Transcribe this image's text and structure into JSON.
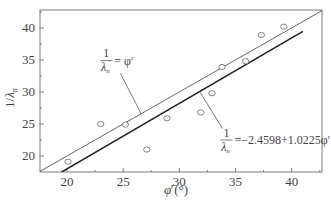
{
  "chart_data": {
    "type": "scatter",
    "title": "",
    "xlabel": "φ' (°)",
    "xlabel_var": "φ",
    "xlabel_sup": "r",
    "xlabel_unit": "(°)",
    "ylabel": "1/λn",
    "ylabel_num": "1/",
    "ylabel_var": "λ",
    "ylabel_sub": "n",
    "xlim": [
      17.6,
      42.7
    ],
    "ylim": [
      17.5,
      42.8
    ],
    "xticks": [
      20,
      25,
      30,
      35,
      40
    ],
    "yticks": [
      20,
      25,
      30,
      35,
      40
    ],
    "xticks_minor": [
      22.5,
      27.5,
      32.5,
      37.5,
      42.5
    ],
    "yticks_minor": [
      22.5,
      27.5,
      32.5,
      37.5,
      42.5
    ],
    "grid": false,
    "series": [
      {
        "name": "measured",
        "kind": "scatter",
        "marker": "open-circle",
        "points": [
          {
            "x": 20.1,
            "y": 19.1
          },
          {
            "x": 23.0,
            "y": 25.0
          },
          {
            "x": 25.2,
            "y": 24.9
          },
          {
            "x": 27.1,
            "y": 21.0
          },
          {
            "x": 28.9,
            "y": 25.9
          },
          {
            "x": 31.9,
            "y": 26.8
          },
          {
            "x": 32.9,
            "y": 29.8
          },
          {
            "x": 33.8,
            "y": 33.9
          },
          {
            "x": 35.9,
            "y": 34.8
          },
          {
            "x": 37.3,
            "y": 38.9
          },
          {
            "x": 39.3,
            "y": 40.2
          }
        ]
      },
      {
        "name": "identity",
        "kind": "line",
        "intercept": 0,
        "slope": 1,
        "x_range": [
          17.6,
          42.7
        ],
        "label": "1/λn = φ'"
      },
      {
        "name": "fit",
        "kind": "line",
        "intercept": -2.4598,
        "slope": 1.0225,
        "x_range": [
          19.5,
          41.0
        ],
        "label": "1/λn = −2.4598+1.0225φ'"
      }
    ],
    "annotations": [
      {
        "target": "identity",
        "numerator": "1",
        "denominator_var": "λ",
        "denominator_sub": "n",
        "rhs": "= φ",
        "rhs_sup": "r",
        "anchor_data": {
          "x": 26.6,
          "y": 26.6
        },
        "text_pos_data": {
          "x": 23.5,
          "y": 34.5
        }
      },
      {
        "target": "fit",
        "numerator": "1",
        "denominator_var": "λ",
        "denominator_sub": "n",
        "rhs": "=−2.4598+1.0225φ",
        "rhs_sup": "r",
        "anchor_data": {
          "x": 31.8,
          "y": 30.1
        },
        "text_pos_data": {
          "x": 34.2,
          "y": 22.1
        }
      }
    ],
    "colors": {
      "frame": "#7a7a7a",
      "identity_line": "#555555",
      "fit_line": "#222222",
      "marker": "#777777",
      "text": "#444444"
    }
  }
}
